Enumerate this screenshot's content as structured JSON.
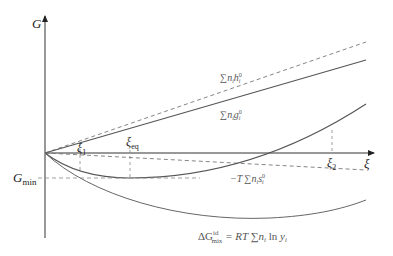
{
  "diagram": {
    "type": "gibbs-energy-vs-extent-of-reaction",
    "axes": {
      "y_label": "G",
      "x_label": "ξ",
      "g_min_label_main": "G",
      "g_min_label_sub": "min"
    },
    "markers": {
      "xi1": {
        "main": "ξ",
        "sub": "1"
      },
      "xi_eq": {
        "main": "ξ",
        "sub": "eq"
      },
      "xi2": {
        "main": "ξ",
        "sub": "2"
      }
    },
    "curves": {
      "enthalpy": {
        "label_sum": "∑",
        "label_n": "n",
        "label_i": "i",
        "label_h": "h",
        "label_sup": "0",
        "label_sub": "i",
        "style": "dashed"
      },
      "gibbs_standard": {
        "label_sum": "∑",
        "label_n": "n",
        "label_i": "i",
        "label_g": "g",
        "label_sup": "0",
        "label_sub": "i",
        "style": "solid"
      },
      "entropy": {
        "label_prefix": "−T",
        "label_sum": "∑",
        "label_n": "n",
        "label_i": "i",
        "label_s": "s",
        "label_sup": "0",
        "label_sub": "i",
        "style": "dashed"
      },
      "mixing": {
        "label_delta": "ΔG",
        "label_sup": "id",
        "label_sub": "mix",
        "label_eq": " = RT ",
        "label_sum": "∑",
        "label_n": "n",
        "label_i": "i",
        "label_ln": " ln ",
        "label_y": "y",
        "label_yi": "i",
        "style": "solid"
      }
    },
    "colors": {
      "axis": "#333333",
      "curve": "#555555",
      "dashed": "#777777",
      "label": "#666666"
    }
  }
}
